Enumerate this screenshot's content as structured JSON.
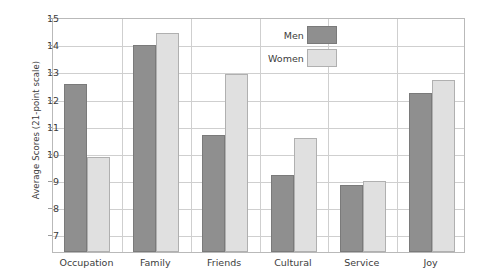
{
  "chart_data": {
    "type": "bar",
    "title": "",
    "subtitle": "",
    "xlabel": "",
    "ylabel": "Average Scores (21-point scale)",
    "categories": [
      "Occupation",
      "Family",
      "Friends",
      "Cultural",
      "Service",
      "Joy"
    ],
    "series": [
      {
        "name": "Men",
        "color": "#8f8f8f",
        "values": [
          12.55,
          13.98,
          10.65,
          9.2,
          8.8,
          12.2
        ]
      },
      {
        "name": "Women",
        "color": "#e0e0e0",
        "values": [
          9.85,
          14.4,
          12.9,
          10.55,
          8.95,
          12.7
        ]
      }
    ],
    "ylim": [
      6.35,
      15
    ],
    "yticks": [
      15,
      14,
      13,
      12,
      11,
      10,
      9,
      8,
      7
    ],
    "ytick_labels": [
      "15",
      "14",
      "13",
      "12",
      "11",
      "10",
      "9",
      "8",
      "7"
    ],
    "grid": true,
    "grid_axis": "y",
    "legend_position": "top-center-right",
    "legend": [
      "Men",
      "Women"
    ],
    "frame": true,
    "background": "#ffffff"
  },
  "legend": {
    "men_label": "Men",
    "women_label": "Women"
  },
  "axis": {
    "y_title": "Average Scores (21-point scale)"
  }
}
